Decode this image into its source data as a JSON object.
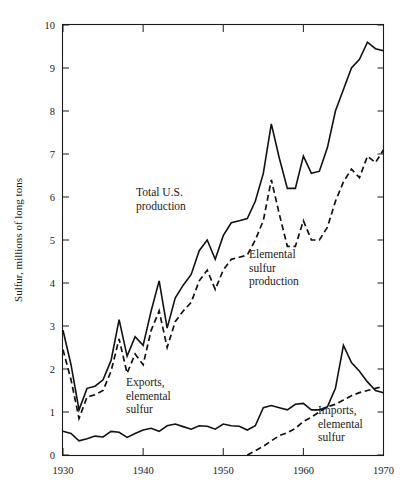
{
  "chart_data": {
    "type": "line",
    "title": "",
    "xlabel": "",
    "ylabel": "Sulfur, millions of long tons",
    "xlim": [
      1930,
      1970
    ],
    "ylim": [
      0,
      10
    ],
    "grid": false,
    "legend_position": "inline-annotations",
    "x_ticks": [
      1930,
      1940,
      1950,
      1960,
      1970
    ],
    "x_tick_labels": [
      "1930",
      "1940",
      "1950",
      "1960",
      "1970"
    ],
    "y_ticks": [
      0,
      1,
      2,
      3,
      4,
      5,
      6,
      7,
      8,
      9,
      10
    ],
    "y_tick_labels": [
      "0",
      "1",
      "2",
      "3",
      "4",
      "5",
      "6",
      "7",
      "8",
      "9",
      "10"
    ],
    "x": [
      1930,
      1931,
      1932,
      1933,
      1934,
      1935,
      1936,
      1937,
      1938,
      1939,
      1940,
      1941,
      1942,
      1943,
      1944,
      1945,
      1946,
      1947,
      1948,
      1949,
      1950,
      1951,
      1952,
      1953,
      1954,
      1955,
      1956,
      1957,
      1958,
      1959,
      1960,
      1961,
      1962,
      1963,
      1964,
      1965,
      1966,
      1967,
      1968,
      1969,
      1970
    ],
    "series": [
      {
        "name": "Total U.S. production",
        "style": "solid",
        "label": "Total U.S.\nproduction",
        "values": [
          2.9,
          2.1,
          1.05,
          1.55,
          1.6,
          1.75,
          2.2,
          3.15,
          2.3,
          2.75,
          2.55,
          3.35,
          4.05,
          2.95,
          3.65,
          3.95,
          4.2,
          4.75,
          5.0,
          4.55,
          5.1,
          5.4,
          5.45,
          5.5,
          5.9,
          6.55,
          7.7,
          6.9,
          6.2,
          6.2,
          6.95,
          6.55,
          6.6,
          7.15,
          8.0,
          8.5,
          9.0,
          9.2,
          9.6,
          9.45,
          9.4
        ]
      },
      {
        "name": "Elemental sulfur production",
        "style": "dashed",
        "label": "Elemental\nsulfur\nproduction",
        "values": [
          2.45,
          1.75,
          0.85,
          1.35,
          1.4,
          1.5,
          1.95,
          2.7,
          1.9,
          2.35,
          2.1,
          2.9,
          3.35,
          2.5,
          3.1,
          3.35,
          3.55,
          4.05,
          4.3,
          3.85,
          4.3,
          4.55,
          4.6,
          4.65,
          5.0,
          5.45,
          6.4,
          5.6,
          4.85,
          4.85,
          5.45,
          5.0,
          5.0,
          5.3,
          5.9,
          6.35,
          6.65,
          6.45,
          6.95,
          6.8,
          7.1
        ]
      },
      {
        "name": "Exports, elemental sulfur",
        "style": "solid",
        "label": "Exports,\nelemental\nsulfur",
        "values": [
          0.55,
          0.5,
          0.33,
          0.38,
          0.44,
          0.42,
          0.55,
          0.53,
          0.41,
          0.5,
          0.58,
          0.62,
          0.55,
          0.68,
          0.72,
          0.66,
          0.6,
          0.68,
          0.67,
          0.6,
          0.72,
          0.68,
          0.67,
          0.58,
          0.68,
          1.1,
          1.15,
          1.1,
          1.05,
          1.18,
          1.2,
          1.05,
          1.05,
          1.12,
          1.55,
          2.55,
          2.15,
          1.95,
          1.7,
          1.5,
          1.45
        ]
      },
      {
        "name": "Imports, elemental sulfur",
        "style": "dashed",
        "label": "Imports,\nelemental\nsulfur",
        "values": [
          null,
          null,
          null,
          null,
          null,
          null,
          null,
          null,
          null,
          null,
          null,
          null,
          null,
          null,
          null,
          null,
          null,
          null,
          null,
          null,
          null,
          null,
          null,
          0.0,
          0.1,
          0.2,
          0.33,
          0.45,
          0.52,
          0.62,
          0.78,
          0.88,
          1.0,
          1.12,
          1.18,
          1.28,
          1.38,
          1.45,
          1.5,
          1.55,
          1.6
        ]
      }
    ],
    "annotations": [
      {
        "text": "Total U.S.\nproduction",
        "x_px": 136,
        "y_px": 196
      },
      {
        "text": "Elemental\nsulfur\nproduction",
        "x_px": 249,
        "y_px": 258
      },
      {
        "text": "Exports,\nelemental\nsulfur",
        "x_px": 126,
        "y_px": 386
      },
      {
        "text": "Imports,\nelemental\nsulfur",
        "x_px": 318,
        "y_px": 414
      }
    ],
    "colors": {
      "line": "#111111",
      "axis": "#1a1a1a",
      "background": "#ffffff"
    }
  }
}
